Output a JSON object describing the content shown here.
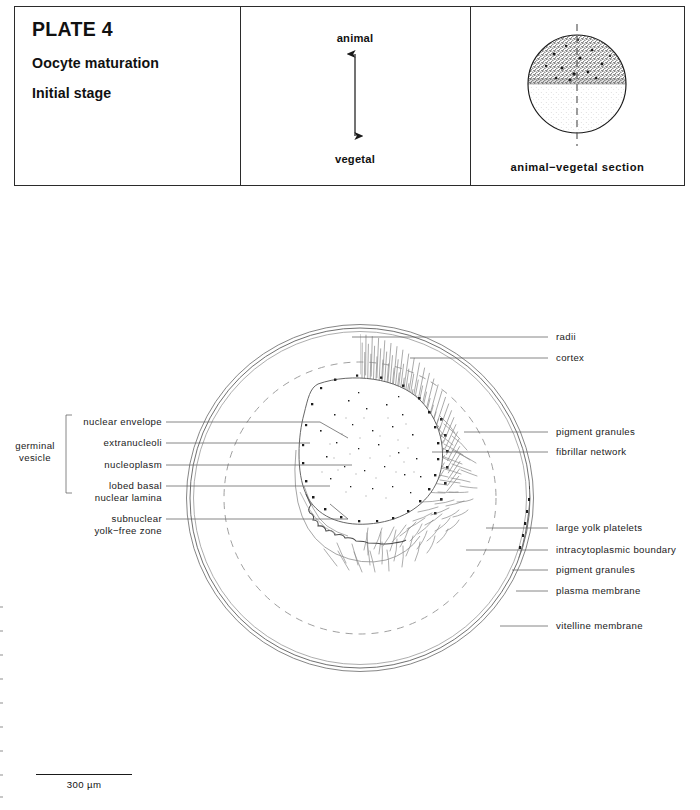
{
  "header": {
    "plate_number": "PLATE 4",
    "subtitle_1": "Oocyte maturation",
    "subtitle_2": "Initial stage",
    "axis": {
      "top_label": "animal",
      "bottom_label": "vegetal",
      "icon": "double-headed-vertical-arrow"
    },
    "section": {
      "caption": "animal−vegetal section",
      "icon": "animal-vegetal-sphere",
      "animal_hemisphere": "dark dense stipple",
      "vegetal_hemisphere": "light sparse stipple",
      "axis_line_style": "dashed"
    }
  },
  "labels_left": {
    "bracket_label": "germinal\nvesicle",
    "bracket_label_line_1": "germinal",
    "bracket_label_line_2": "vesicle",
    "items": [
      {
        "text": "nuclear envelope",
        "lines": [
          "nuclear  envelope"
        ]
      },
      {
        "text": "extranucleoli",
        "lines": [
          "extranucleoli"
        ]
      },
      {
        "text": "nucleoplasm",
        "lines": [
          "nucleoplasm"
        ]
      },
      {
        "text": "lobed basal nuclear lamina",
        "lines": [
          "lobed basal",
          "nuclear  lamina"
        ]
      },
      {
        "text": "subnuclear yolk-free zone",
        "lines": [
          "subnuclear",
          "yolk−free zone"
        ]
      }
    ]
  },
  "labels_right": {
    "items": [
      {
        "text": "radii"
      },
      {
        "text": "cortex"
      },
      {
        "text": "pigment granules"
      },
      {
        "text": "fibrillar network"
      },
      {
        "text": "large yolk platelets"
      },
      {
        "text": "intracytoplasmic boundary"
      },
      {
        "text": "pigment granules"
      },
      {
        "text": "plasma membrane"
      },
      {
        "text": "vitelline membrane"
      }
    ]
  },
  "scale": {
    "value": "300 µm",
    "bar_name": "scale-bar"
  },
  "colors": {
    "ink": "#1a1a1a",
    "frame": "#2b2b2b",
    "leader": "#6a6a6a",
    "outline": "#5a5a5a",
    "stipple_dark": "#2a2a2a",
    "stipple_light": "#8c8c8c",
    "background": "#ffffff"
  }
}
